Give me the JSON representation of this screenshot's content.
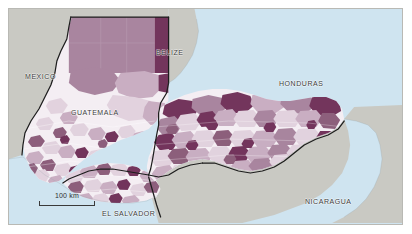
{
  "figure": {
    "kind": "choropleth-map",
    "region_title": "Central America"
  },
  "map": {
    "ocean_color": "#cfe4f0",
    "frame_color": "#b9b9b4",
    "background_color": "#ffffff",
    "non_study_country_color": "#c9c9c3",
    "border_line_color": "#1d1d1d",
    "labels": [
      {
        "id": "mexico",
        "text": "MEXICO"
      },
      {
        "id": "belize",
        "text": "BELIZE"
      },
      {
        "id": "guatemala",
        "text": "GUATEMALA"
      },
      {
        "id": "honduras",
        "text": "HONDURAS"
      },
      {
        "id": "el-salvador",
        "text": "EL SALVADOR"
      },
      {
        "id": "nicaragua",
        "text": "NICARAGUA"
      }
    ],
    "scalebar": {
      "label": "100 km",
      "length_km": 100
    },
    "choropleth_palette": [
      {
        "level": 1,
        "color": "#f4eef3"
      },
      {
        "level": 2,
        "color": "#e2d2de"
      },
      {
        "level": 3,
        "color": "#c9aec2"
      },
      {
        "level": 4,
        "color": "#a9859f"
      },
      {
        "level": 5,
        "color": "#8d5f7c"
      },
      {
        "level": 6,
        "color": "#73355c"
      }
    ]
  }
}
